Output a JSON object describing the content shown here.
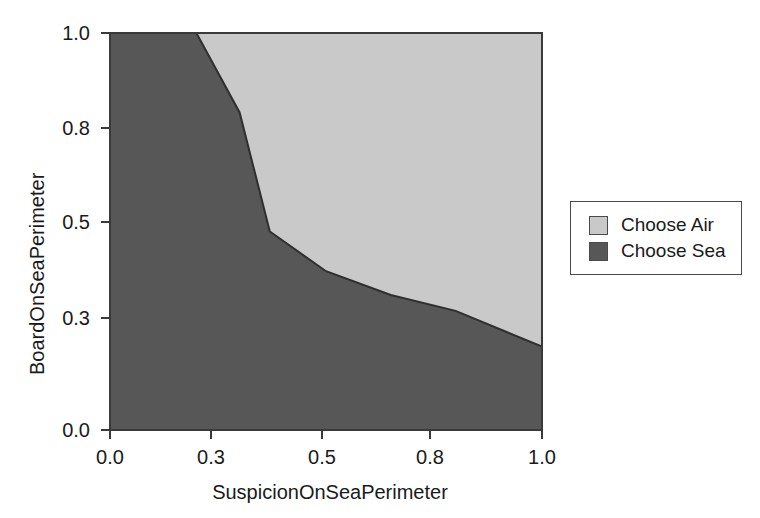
{
  "chart_data": {
    "type": "area",
    "title": "",
    "xlabel": "SuspicionOnSeaPerimeter",
    "ylabel": "BoardOnSeaPerimeter",
    "xlim": [
      0.0,
      1.0
    ],
    "ylim": [
      0.0,
      1.0
    ],
    "grid": false,
    "xticks": [
      "0.0",
      "0.3",
      "0.5",
      "0.8",
      "1.0"
    ],
    "xtick_values": [
      0.0,
      0.3,
      0.5,
      0.8,
      1.0
    ],
    "yticks": [
      "0.0",
      "0.3",
      "0.5",
      "0.8",
      "1.0"
    ],
    "ytick_values": [
      0.0,
      0.3,
      0.5,
      0.8,
      1.0
    ],
    "legend_position": "right-outside",
    "regions": [
      {
        "name": "Choose Air",
        "color": "#c9c9c9",
        "description": "upper-right region above the decision boundary"
      },
      {
        "name": "Choose Sea",
        "color": "#575757",
        "description": "lower-left region below the decision boundary"
      }
    ],
    "boundary": {
      "name": "decision-boundary",
      "x": [
        0.2,
        0.3,
        0.37,
        0.5,
        0.65,
        0.8,
        1.0
      ],
      "y": [
        1.0,
        0.8,
        0.5,
        0.4,
        0.34,
        0.3,
        0.21
      ]
    },
    "series": [
      {
        "name": "Choose Air",
        "color": "#c9c9c9",
        "x": [
          0.2,
          0.3,
          0.37,
          0.5,
          0.65,
          0.8,
          1.0
        ],
        "values": [
          1.0,
          0.8,
          0.5,
          0.4,
          0.34,
          0.3,
          0.21
        ]
      },
      {
        "name": "Choose Sea",
        "color": "#575757",
        "x": [
          0.2,
          0.3,
          0.37,
          0.5,
          0.65,
          0.8,
          1.0
        ],
        "values": [
          1.0,
          0.8,
          0.5,
          0.4,
          0.34,
          0.3,
          0.21
        ]
      }
    ]
  },
  "axes": {
    "x_title": "SuspicionOnSeaPerimeter",
    "y_title": "BoardOnSeaPerimeter",
    "x_tick_labels": [
      "0.0",
      "0.3",
      "0.5",
      "0.8",
      "1.0"
    ],
    "y_tick_labels": [
      "0.0",
      "0.3",
      "0.5",
      "0.8",
      "1.0"
    ]
  },
  "legend": {
    "items": [
      {
        "label": "Choose Air",
        "color": "#c9c9c9"
      },
      {
        "label": "Choose Sea",
        "color": "#575757"
      }
    ]
  },
  "colors": {
    "air": "#c9c9c9",
    "sea": "#575757",
    "axis": "#3a3a3a",
    "boundary": "#2f2f2f",
    "background": "#ffffff"
  }
}
